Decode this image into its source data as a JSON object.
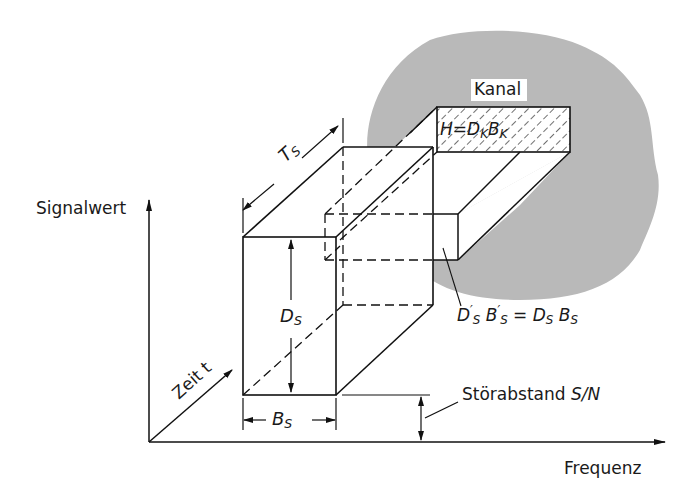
{
  "diagram": {
    "axes": {
      "y_label": "Signalwert",
      "x_label": "Frequenz",
      "z_label": "Zeit t"
    },
    "channel": {
      "label": "Kanal",
      "formula": "H = D_K B_K",
      "formula_parts": {
        "h": "H",
        "eq": "=",
        "d": "D",
        "dsub": "K",
        "b": "B",
        "bsub": "K"
      },
      "region_color": "#b9b9b9"
    },
    "signal": {
      "duration": {
        "sym": "T",
        "sub": "S"
      },
      "dynamic": {
        "sym": "D",
        "sub": "S"
      },
      "bandwidth": {
        "sym": "B",
        "sub": "S"
      },
      "transformed_equation": "D'_S B'_S = D_S B_S",
      "eq_parts": {
        "d1": "D",
        "d1sup": "′",
        "d1sub": "S",
        "b1": "B",
        "b1sup": "′",
        "b1sub": "S",
        "eq": "=",
        "d2": "D",
        "d2sub": "S",
        "b2": "B",
        "b2sub": "S"
      }
    },
    "noise_margin": {
      "label": "Störabstand",
      "sym": "S/N"
    }
  }
}
